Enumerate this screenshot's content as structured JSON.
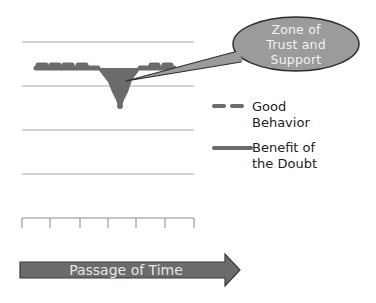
{
  "callout": {
    "line1": "Zone of",
    "line2": "Trust and",
    "line3": "Support"
  },
  "legend": {
    "items": [
      {
        "style": "dashed",
        "line1": "Good",
        "line2": "Behavior"
      },
      {
        "style": "solid",
        "line1": "Benefit of",
        "line2": "the Doubt"
      }
    ]
  },
  "arrow": {
    "label": "Passage of Time"
  },
  "colors": {
    "shape_fill": "#6b6b6b",
    "callout_fill": "#9b9b9b",
    "outline": "#3a3a3a",
    "grid": "#a0a0a0"
  },
  "grid": {
    "lines_y": [
      42,
      86,
      130,
      174
    ],
    "axis_y": 218,
    "ticks_x": [
      22,
      50,
      80,
      108,
      136,
      165,
      194
    ]
  }
}
